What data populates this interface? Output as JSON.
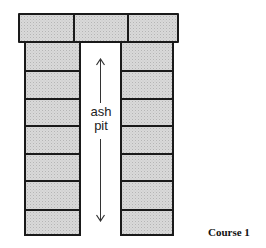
{
  "diagram": {
    "title": "Course 1",
    "cap_bricks": 3,
    "left_column_bricks": 7,
    "right_column_bricks": 7,
    "center_label_line1": "ash",
    "center_label_line2": "pit",
    "arrow": "double-headed vertical arrow spanning the ash pit",
    "colors": {
      "brick_fill": "#d9d9d9",
      "outline": "#1a1a1a",
      "background": "#ffffff"
    }
  }
}
